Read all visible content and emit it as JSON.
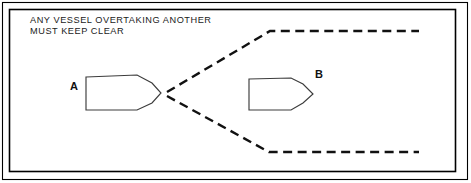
{
  "figure": {
    "background_color": "#ffffff",
    "frame_color": "#000000",
    "width": 471,
    "height": 183
  },
  "caption": {
    "line1": "ANY VESSEL OVERTAKING ANOTHER",
    "line2": "MUST KEEP CLEAR",
    "x": 30,
    "y": 20,
    "color": "#1a1a1a"
  },
  "vessels": [
    {
      "id": "A",
      "label": "A",
      "role": "overtaking-vessel",
      "label_x": 74,
      "label_y": 90,
      "heading": "right",
      "points": "86,77 137,75 152,83 161,93 152,103 137,110 86,110",
      "stroke_color": "#3c3c3c",
      "fill_color": "#ffffff"
    },
    {
      "id": "B",
      "label": "B",
      "role": "vessel-being-overtaken",
      "label_x": 316,
      "label_y": 76,
      "heading": "right",
      "points": "249,79 291,78 303,84 313,94 303,103 291,110 249,110",
      "stroke_color": "#3c3c3c",
      "fill_color": "#ffffff"
    }
  ],
  "sector_lines": [
    {
      "name": "upper-overtaking-sector-boundary",
      "points": "167,92 270,31 419,31",
      "style": "dashed",
      "color": "#111111"
    },
    {
      "name": "lower-overtaking-sector-boundary",
      "points": "167,96 269,152 419,152",
      "style": "dashed",
      "color": "#111111"
    }
  ],
  "frame": {
    "outer": {
      "x": 2,
      "y": 2,
      "width": 466,
      "height": 178
    },
    "inner": {
      "x": 9,
      "y": 9,
      "width": 447,
      "height": 163
    }
  }
}
